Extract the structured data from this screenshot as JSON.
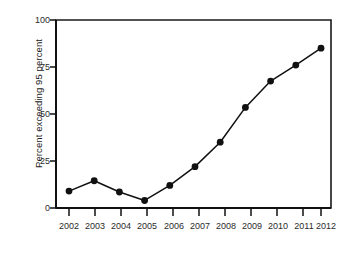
{
  "chart_data": {
    "type": "line",
    "title": "",
    "subtitle": "",
    "xlabel": "",
    "ylabel": "Percent exceeding 95 percent",
    "categories": [
      "2002",
      "2003",
      "2004",
      "2005",
      "2006",
      "2007",
      "2008",
      "2009",
      "2010",
      "2011",
      "2012"
    ],
    "x": [
      2002,
      2003,
      2004,
      2005,
      2006,
      2007,
      2008,
      2009,
      2010,
      2011,
      2012
    ],
    "values": [
      9,
      14.5,
      8.5,
      4,
      12,
      22,
      35,
      53.5,
      67.5,
      76,
      85
    ],
    "series": [
      {
        "name": "Percent exceeding 95 percent",
        "values": [
          9,
          14.5,
          8.5,
          4,
          12,
          22,
          35,
          53.5,
          67.5,
          76,
          85
        ]
      }
    ],
    "ylim": [
      0,
      100
    ],
    "yticks": [
      0,
      25,
      50,
      75,
      100
    ],
    "ytick_labels": [
      "0",
      "25",
      "50",
      "75",
      "100"
    ],
    "xtick_labels": [
      "2002",
      "2003",
      "2004",
      "2005",
      "2006",
      "2007",
      "2008",
      "2009",
      "2010",
      "2011",
      "2012"
    ],
    "grid": false,
    "legend": false,
    "legend_position": "none",
    "marker": "filled-circle",
    "line_color": "#111111",
    "marker_color": "#111111",
    "axis_color": "#1a1a1a",
    "background_color": "#ffffff",
    "annotations": []
  },
  "figure": {
    "margin_note": ""
  }
}
